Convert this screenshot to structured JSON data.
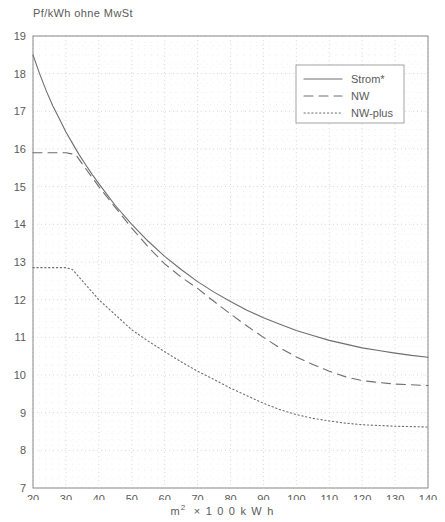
{
  "chart_data": {
    "type": "line",
    "title": "Pf/kWh ohne MwSt",
    "xlabel": "m²  ×  1 0 0   k W h",
    "xlabel_main": "m",
    "xlabel_sup": "2",
    "xlabel_rest": "×  1 0 0   k W h",
    "ylabel": "",
    "xlim": [
      20,
      140
    ],
    "ylim": [
      7,
      19
    ],
    "xticks": [
      20,
      30,
      40,
      50,
      60,
      70,
      80,
      90,
      100,
      110,
      120,
      130,
      140
    ],
    "yticks": [
      7,
      8,
      9,
      10,
      11,
      12,
      13,
      14,
      15,
      16,
      17,
      18,
      19
    ],
    "grid": true,
    "grid_style": "dotted",
    "legend_position": "top-right",
    "axis_color": "#8a8a8a",
    "grid_color": "#d8d8d8",
    "line_color": "#6e6e6e",
    "series": [
      {
        "name": "Strom*",
        "dash": "solid",
        "x": [
          20,
          22,
          24,
          26,
          28,
          30,
          32,
          34,
          36,
          38,
          40,
          45,
          50,
          55,
          60,
          65,
          70,
          75,
          80,
          85,
          90,
          95,
          100,
          105,
          110,
          115,
          120,
          125,
          130,
          135,
          140
        ],
        "values": [
          18.5,
          18.0,
          17.55,
          17.15,
          16.8,
          16.45,
          16.15,
          15.85,
          15.58,
          15.32,
          15.08,
          14.5,
          14.0,
          13.55,
          13.15,
          12.8,
          12.48,
          12.2,
          11.95,
          11.72,
          11.52,
          11.35,
          11.18,
          11.05,
          10.92,
          10.82,
          10.72,
          10.65,
          10.58,
          10.52,
          10.47
        ]
      },
      {
        "name": "NW",
        "dash": "dashed",
        "x": [
          20,
          25,
          30,
          33,
          35,
          40,
          45,
          50,
          55,
          60,
          65,
          70,
          75,
          80,
          85,
          90,
          95,
          100,
          105,
          110,
          115,
          120,
          125,
          130,
          135,
          140
        ],
        "values": [
          15.9,
          15.9,
          15.9,
          15.85,
          15.6,
          15.0,
          14.45,
          13.9,
          13.4,
          12.95,
          12.6,
          12.3,
          11.95,
          11.62,
          11.3,
          11.0,
          10.72,
          10.48,
          10.28,
          10.1,
          9.95,
          9.85,
          9.8,
          9.76,
          9.74,
          9.72
        ]
      },
      {
        "name": "NW-plus",
        "dash": "dotted",
        "x": [
          20,
          25,
          30,
          32,
          35,
          40,
          45,
          50,
          55,
          60,
          65,
          70,
          75,
          80,
          85,
          90,
          95,
          100,
          105,
          110,
          115,
          120,
          125,
          130,
          135,
          140
        ],
        "values": [
          12.85,
          12.85,
          12.85,
          12.8,
          12.5,
          12.0,
          11.6,
          11.2,
          10.9,
          10.62,
          10.35,
          10.1,
          9.88,
          9.65,
          9.45,
          9.25,
          9.08,
          8.95,
          8.85,
          8.78,
          8.72,
          8.68,
          8.66,
          8.64,
          8.63,
          8.62
        ]
      }
    ]
  },
  "legend": {
    "items": [
      {
        "label": "Strom*",
        "dash": "solid"
      },
      {
        "label": "NW",
        "dash": "dashed"
      },
      {
        "label": "NW-plus",
        "dash": "dotted"
      }
    ]
  }
}
